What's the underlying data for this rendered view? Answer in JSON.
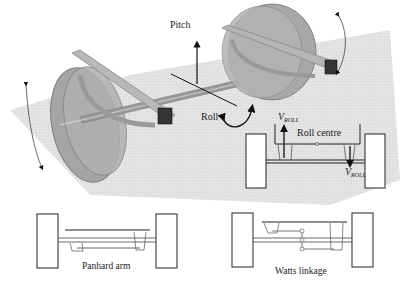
{
  "diagram": {
    "type": "vehicle-rear-axle-suspension-illustration",
    "labels": {
      "pitch": "Pitch",
      "roll": "Roll",
      "roll_centre": "Roll centre",
      "v_roll_top": "V",
      "v_roll_top_sub": "ROLL",
      "v_roll_bottom": "V",
      "v_roll_bottom_sub": "ROLL",
      "panhard_arm": "Panhard arm",
      "watts_linkage": "Watts linkage"
    },
    "panels": [
      {
        "name": "3d-axle-view",
        "description": "Perspective view of rigid axle with two wheels, trailing arms, pitch and roll axes"
      },
      {
        "name": "roll-centre-view",
        "description": "Rear view showing roll centre and opposing vertical roll forces"
      },
      {
        "name": "panhard-arm-view",
        "description": "Rear view of axle located by a Panhard arm"
      },
      {
        "name": "watts-linkage-view",
        "description": "Rear view of axle located by a Watts linkage"
      }
    ],
    "colors": {
      "ground_plane": "#d9d9d9",
      "wheel_fill": "#a8a8a8",
      "arm_fill": "#b5b5b5",
      "line": "#222222"
    }
  }
}
